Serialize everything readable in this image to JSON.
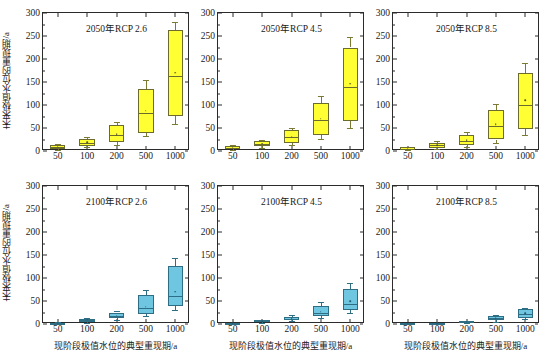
{
  "figure": {
    "ylabel": "未来极值水位的重现期/a",
    "xlabel": "现阶段极值水位的典型重现期/a",
    "y_ticks": [
      "0",
      "50",
      "100",
      "150",
      "200",
      "250",
      "300"
    ],
    "x_ticks": [
      "50",
      "100",
      "200",
      "500",
      "1000"
    ]
  },
  "chart_data": {
    "type": "box",
    "title": "",
    "xlabel": "现阶段极值水位的典型重现期/a",
    "ylabel": "未来极值水位的重现期/a",
    "ylim": [
      0,
      300
    ],
    "y_ticks": [
      0,
      50,
      100,
      150,
      200,
      250,
      300
    ],
    "grid": false,
    "legend_position": "none",
    "categories": [
      "50",
      "100",
      "200",
      "500",
      "1000"
    ],
    "colors": {
      "top_row_box": "#FFFF33",
      "bottom_row_box": "#6EC6E0",
      "axis": "#2b2b2b"
    },
    "panels": [
      {
        "title": "2050年RCP 2.6",
        "row": 0,
        "col": 0,
        "box_color": "#FFFF33",
        "boxes": [
          {
            "category": "50",
            "whisker_low": 3,
            "q1": 5,
            "median": 9,
            "q3": 14,
            "whisker_high": 16,
            "mean": 9
          },
          {
            "category": "100",
            "whisker_low": 8,
            "q1": 11,
            "median": 18,
            "q3": 26,
            "whisker_high": 30,
            "mean": 19
          },
          {
            "category": "200",
            "whisker_low": 13,
            "q1": 19,
            "median": 35,
            "q3": 56,
            "whisker_high": 63,
            "mean": 37
          },
          {
            "category": "500",
            "whisker_low": 32,
            "q1": 40,
            "median": 83,
            "q3": 135,
            "whisker_high": 154,
            "mean": 88
          },
          {
            "category": "1000",
            "whisker_low": 58,
            "q1": 76,
            "median": 163,
            "q3": 262,
            "whisker_high": 280,
            "mean": 170
          }
        ]
      },
      {
        "title": "2050年RCP 4.5",
        "row": 0,
        "col": 1,
        "box_color": "#FFFF33",
        "boxes": [
          {
            "category": "50",
            "whisker_low": 2,
            "q1": 4,
            "median": 7,
            "q3": 10,
            "whisker_high": 12,
            "mean": 7
          },
          {
            "category": "100",
            "whisker_low": 7,
            "q1": 10,
            "median": 16,
            "q3": 22,
            "whisker_high": 25,
            "mean": 16
          },
          {
            "category": "200",
            "whisker_low": 12,
            "q1": 17,
            "median": 30,
            "q3": 45,
            "whisker_high": 50,
            "mean": 31
          },
          {
            "category": "500",
            "whisker_low": 26,
            "q1": 34,
            "median": 67,
            "q3": 105,
            "whisker_high": 120,
            "mean": 70
          },
          {
            "category": "1000",
            "whisker_low": 50,
            "q1": 66,
            "median": 140,
            "q3": 225,
            "whisker_high": 247,
            "mean": 146
          }
        ]
      },
      {
        "title": "2050年RCP 8.5",
        "row": 0,
        "col": 2,
        "box_color": "#FFFF33",
        "boxes": [
          {
            "category": "50",
            "whisker_low": 2,
            "q1": 3,
            "median": 5,
            "q3": 8,
            "whisker_high": 9,
            "mean": 5
          },
          {
            "category": "100",
            "whisker_low": 5,
            "q1": 7,
            "median": 12,
            "q3": 18,
            "whisker_high": 21,
            "mean": 12
          },
          {
            "category": "200",
            "whisker_low": 9,
            "q1": 13,
            "median": 22,
            "q3": 35,
            "whisker_high": 41,
            "mean": 23
          },
          {
            "category": "500",
            "whisker_low": 18,
            "q1": 25,
            "median": 55,
            "q3": 89,
            "whisker_high": 102,
            "mean": 58
          },
          {
            "category": "1000",
            "whisker_low": 35,
            "q1": 48,
            "median": 101,
            "q3": 170,
            "whisker_high": 191,
            "mean": 110
          }
        ]
      },
      {
        "title": "2100年RCP 2.6",
        "row": 1,
        "col": 0,
        "box_color": "#6EC6E0",
        "boxes": [
          {
            "category": "50",
            "whisker_low": 1,
            "q1": 1,
            "median": 2,
            "q3": 3,
            "whisker_high": 4,
            "mean": 2
          },
          {
            "category": "100",
            "whisker_low": 3,
            "q1": 5,
            "median": 9,
            "q3": 11,
            "whisker_high": 13,
            "mean": 9
          },
          {
            "category": "200",
            "whisker_low": 8,
            "q1": 12,
            "median": 17,
            "q3": 25,
            "whisker_high": 29,
            "mean": 18
          },
          {
            "category": "500",
            "whisker_low": 17,
            "q1": 22,
            "median": 34,
            "q3": 63,
            "whisker_high": 73,
            "mean": 38
          },
          {
            "category": "1000",
            "whisker_low": 30,
            "q1": 40,
            "median": 60,
            "q3": 127,
            "whisker_high": 144,
            "mean": 70
          }
        ]
      },
      {
        "title": "2100年RCP 4.5",
        "row": 1,
        "col": 1,
        "box_color": "#6EC6E0",
        "boxes": [
          {
            "category": "50",
            "whisker_low": 1,
            "q1": 1,
            "median": 2,
            "q3": 3,
            "whisker_high": 3,
            "mean": 2
          },
          {
            "category": "100",
            "whisker_low": 3,
            "q1": 4,
            "median": 6,
            "q3": 8,
            "whisker_high": 9,
            "mean": 6
          },
          {
            "category": "200",
            "whisker_low": 6,
            "q1": 8,
            "median": 11,
            "q3": 16,
            "whisker_high": 19,
            "mean": 12
          },
          {
            "category": "500",
            "whisker_low": 13,
            "q1": 17,
            "median": 24,
            "q3": 40,
            "whisker_high": 47,
            "mean": 27
          },
          {
            "category": "1000",
            "whisker_low": 24,
            "q1": 30,
            "median": 43,
            "q3": 77,
            "whisker_high": 89,
            "mean": 50
          }
        ]
      },
      {
        "title": "2100年RCP 8.5",
        "row": 1,
        "col": 2,
        "box_color": "#6EC6E0",
        "boxes": [
          {
            "category": "50",
            "whisker_low": 0,
            "q1": 1,
            "median": 1,
            "q3": 2,
            "whisker_high": 2,
            "mean": 1
          },
          {
            "category": "100",
            "whisker_low": 1,
            "q1": 1,
            "median": 2,
            "q3": 3,
            "whisker_high": 3,
            "mean": 2
          },
          {
            "category": "200",
            "whisker_low": 2,
            "q1": 3,
            "median": 4,
            "q3": 6,
            "whisker_high": 7,
            "mean": 5
          },
          {
            "category": "500",
            "whisker_low": 5,
            "q1": 8,
            "median": 13,
            "q3": 18,
            "whisker_high": 20,
            "mean": 13
          },
          {
            "category": "1000",
            "whisker_low": 10,
            "q1": 14,
            "median": 22,
            "q3": 32,
            "whisker_high": 35,
            "mean": 23
          }
        ]
      }
    ]
  }
}
